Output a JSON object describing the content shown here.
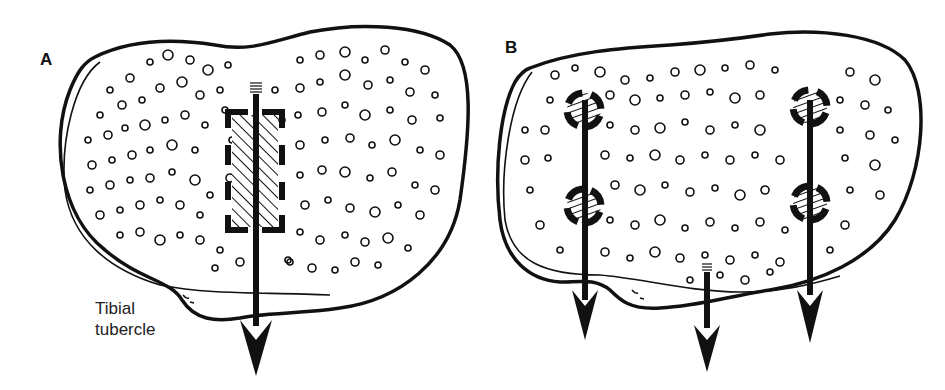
{
  "figure": {
    "panels": [
      {
        "id": "A",
        "label": "A",
        "description": "Tibial cross-section with single rectangular hatched graft and one central arrow",
        "annotation": {
          "line1": "Tibial",
          "line2": "tubercle"
        },
        "arrow_count": 1,
        "graft_shape": "rectangle"
      },
      {
        "id": "B",
        "label": "B",
        "description": "Tibial cross-section with four circular hatched plugs and three arrows",
        "arrow_count": 3,
        "graft_shape": "circle",
        "plug_count": 4
      }
    ],
    "colors": {
      "ink": "#111111",
      "background": "#ffffff"
    }
  }
}
